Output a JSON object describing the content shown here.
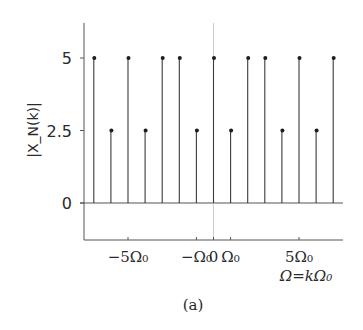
{
  "chart_data": {
    "type": "stem",
    "title": "",
    "caption": "(a)",
    "xlabel": "Ω=kΩ₀",
    "ylabel": "|X_N(k)|",
    "ylim": [
      -1.25,
      6.2
    ],
    "xlim": [
      -7.6,
      7.6
    ],
    "grid": false,
    "legend": null,
    "x": [
      -7,
      -6,
      -5,
      -4,
      -3,
      -2,
      -1,
      0,
      1,
      2,
      3,
      4,
      5,
      6,
      7
    ],
    "values": [
      5,
      2.5,
      5,
      2.5,
      5,
      5,
      2.5,
      5,
      2.5,
      5,
      5,
      2.5,
      5,
      2.5,
      5
    ],
    "y_ticks": [
      {
        "value": 0,
        "label": "0"
      },
      {
        "value": 2.5,
        "label": "2.5"
      },
      {
        "value": 5,
        "label": "5"
      }
    ],
    "x_ticks": [
      {
        "k": -5,
        "label": "−5Ω₀"
      },
      {
        "k": -1,
        "label": "−Ω₀"
      },
      {
        "k": 0,
        "label": "0"
      },
      {
        "k": 1,
        "label": "Ω₀"
      },
      {
        "k": 5,
        "label": "5Ω₀"
      }
    ],
    "zero_line_vertical": true,
    "stem_color": "#3a3a3a",
    "axis_color": "#555555"
  },
  "layout": {
    "plot_left": 84,
    "plot_right": 343,
    "plot_top": 23,
    "axis_bottom": 240,
    "baseline_y": 203,
    "px_per_unit_y": 29,
    "x_center": 213.5,
    "px_per_k": 17.1
  }
}
